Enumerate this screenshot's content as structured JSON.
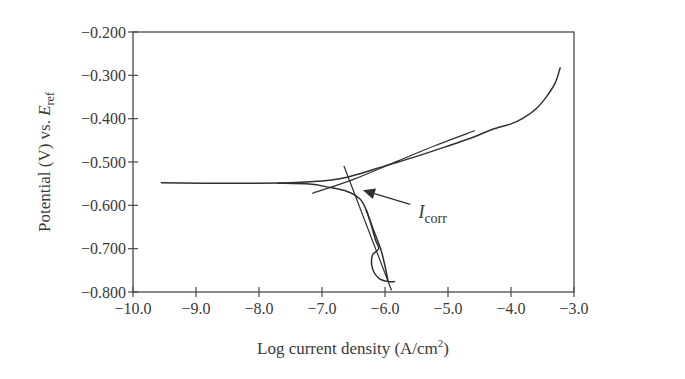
{
  "chart_data": {
    "type": "line",
    "title": "",
    "xlabel": "Log current density (A/cm",
    "xlabel_sup": "2",
    "xlabel_tail": ")",
    "ylabel": "Potential (V) vs. ",
    "ylabel_var": "E",
    "ylabel_sub": "ref",
    "xlim": [
      -10.0,
      -3.0
    ],
    "ylim": [
      -0.8,
      -0.2
    ],
    "grid": false,
    "legend": null,
    "x_ticks": [
      -10.0,
      -9.0,
      -8.0,
      -7.0,
      -6.0,
      -5.0,
      -4.0,
      -3.0
    ],
    "x_tick_labels": [
      "−10.0",
      "−9.0",
      "−8.0",
      "−7.0",
      "−6.0",
      "−5.0",
      "−4.0",
      "−3.0"
    ],
    "y_ticks": [
      -0.2,
      -0.3,
      -0.4,
      -0.5,
      -0.6,
      -0.7,
      -0.8
    ],
    "y_tick_labels": [
      "−0.200",
      "−0.300",
      "−0.400",
      "−0.500",
      "−0.600",
      "−0.700",
      "−0.800"
    ],
    "series": [
      {
        "name": "anodic-branch",
        "points": [
          [
            -9.55,
            -0.548
          ],
          [
            -8.5,
            -0.549
          ],
          [
            -7.5,
            -0.548
          ],
          [
            -7.0,
            -0.544
          ],
          [
            -6.7,
            -0.538
          ],
          [
            -6.4,
            -0.527
          ],
          [
            -6.0,
            -0.509
          ],
          [
            -5.5,
            -0.487
          ],
          [
            -5.0,
            -0.463
          ],
          [
            -4.6,
            -0.443
          ],
          [
            -4.3,
            -0.425
          ],
          [
            -4.0,
            -0.412
          ],
          [
            -3.8,
            -0.398
          ],
          [
            -3.6,
            -0.377
          ],
          [
            -3.45,
            -0.352
          ],
          [
            -3.3,
            -0.318
          ],
          [
            -3.22,
            -0.283
          ]
        ]
      },
      {
        "name": "cathodic-branch",
        "points": [
          [
            -7.7,
            -0.549
          ],
          [
            -7.2,
            -0.551
          ],
          [
            -6.9,
            -0.558
          ],
          [
            -6.6,
            -0.568
          ],
          [
            -6.4,
            -0.585
          ],
          [
            -6.3,
            -0.61
          ],
          [
            -6.22,
            -0.645
          ],
          [
            -6.15,
            -0.68
          ],
          [
            -6.1,
            -0.7
          ],
          [
            -6.2,
            -0.715
          ],
          [
            -6.2,
            -0.745
          ],
          [
            -6.1,
            -0.768
          ],
          [
            -5.95,
            -0.776
          ],
          [
            -5.85,
            -0.776
          ]
        ]
      },
      {
        "name": "cathodic-branch-2",
        "points": [
          [
            -6.3,
            -0.61
          ],
          [
            -6.2,
            -0.65
          ],
          [
            -6.07,
            -0.7
          ],
          [
            -6.0,
            -0.74
          ],
          [
            -5.95,
            -0.776
          ]
        ]
      },
      {
        "name": "anodic-tafel-fit",
        "points": [
          [
            -7.15,
            -0.572
          ],
          [
            -6.5,
            -0.54
          ],
          [
            -5.8,
            -0.498
          ],
          [
            -5.2,
            -0.462
          ],
          [
            -4.58,
            -0.428
          ]
        ]
      },
      {
        "name": "cathodic-tafel-fit",
        "points": [
          [
            -6.65,
            -0.51
          ],
          [
            -5.9,
            -0.795
          ]
        ]
      }
    ],
    "annotations": [
      {
        "text": "I",
        "sub": "corr",
        "meaning": "corrosion current (intersection of Tafel fits)",
        "text_at": [
          -5.47,
          -0.63
        ],
        "arrow_from": [
          -5.6,
          -0.598
        ],
        "arrow_to": [
          -6.35,
          -0.565
        ]
      }
    ]
  },
  "colors": {
    "line": "#2f2f2f",
    "axis": "#4a4a4a",
    "text": "#3a3a3a",
    "background": "#ffffff"
  }
}
